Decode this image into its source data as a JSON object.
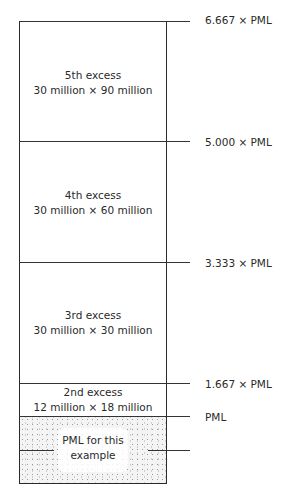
{
  "diagram": {
    "layers": [
      {
        "name": "5th excess",
        "detail": "30 million × 90 million"
      },
      {
        "name": "4th excess",
        "detail": "30 million × 60 million"
      },
      {
        "name": "3rd excess",
        "detail": "30 million × 30 million"
      },
      {
        "name": "2nd excess",
        "detail": "12 million × 18 million"
      },
      {
        "name": "PML for this",
        "detail": "example"
      }
    ],
    "thresholds": [
      {
        "label": "6.667 × PML"
      },
      {
        "label": "5.000 × PML"
      },
      {
        "label": "3.333 × PML"
      },
      {
        "label": "1.667 × PML"
      },
      {
        "label": "PML"
      }
    ]
  }
}
